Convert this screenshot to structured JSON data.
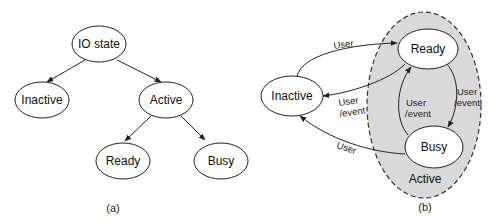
{
  "diagram_a": {
    "caption": "(a)",
    "nodes": {
      "root": "IO state",
      "inactive": "Inactive",
      "active": "Active",
      "ready": "Ready",
      "busy": "Busy"
    }
  },
  "diagram_b": {
    "caption": "(b)",
    "group_label": "Active",
    "nodes": {
      "inactive": "Inactive",
      "ready": "Ready",
      "busy": "Busy"
    },
    "edges": {
      "inactive_to_ready": "User",
      "ready_to_inactive_line1": "User",
      "ready_to_inactive_line2": "/event",
      "ready_to_busy_line1": "User",
      "ready_to_busy_line2": "/event",
      "busy_to_ready_line1": "User",
      "busy_to_ready_line2": "/event",
      "busy_to_inactive": "User"
    }
  },
  "colors": {
    "group_fill": "#d9d9d9",
    "stroke": "#222222",
    "node_fill": "#ffffff"
  }
}
